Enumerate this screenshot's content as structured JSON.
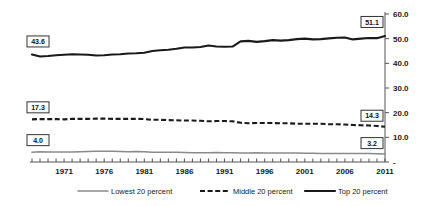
{
  "chart_data": {
    "type": "line",
    "title": "",
    "xlabel": "",
    "ylabel": "",
    "ylim": [
      0,
      60
    ],
    "xlim": [
      1967,
      2011
    ],
    "grid": false,
    "legend_position": "bottom",
    "y_ticks": [
      "-",
      "10.0",
      "20.0",
      "30.0",
      "40.0",
      "50.0",
      "60.0"
    ],
    "y_tick_values": [
      0,
      10,
      20,
      30,
      40,
      50,
      60
    ],
    "x_ticks": [
      "1971",
      "1976",
      "1981",
      "1986",
      "1991",
      "1996",
      "2001",
      "2006",
      "2011"
    ],
    "x_tick_values": [
      1971,
      1976,
      1981,
      1986,
      1991,
      1996,
      2001,
      2006,
      2011
    ],
    "x": [
      1967,
      1968,
      1969,
      1970,
      1971,
      1972,
      1973,
      1974,
      1975,
      1976,
      1977,
      1978,
      1979,
      1980,
      1981,
      1982,
      1983,
      1984,
      1985,
      1986,
      1987,
      1988,
      1989,
      1990,
      1991,
      1992,
      1993,
      1994,
      1995,
      1996,
      1997,
      1998,
      1999,
      2000,
      2001,
      2002,
      2003,
      2004,
      2005,
      2006,
      2007,
      2008,
      2009,
      2010,
      2011
    ],
    "series": [
      {
        "name": "Lowest 20 percent",
        "style": "solid-thin",
        "color": "#8a8a8a",
        "start_label": "4.0",
        "end_label": "3.2",
        "values": [
          4.0,
          4.2,
          4.1,
          4.1,
          4.1,
          4.1,
          4.2,
          4.3,
          4.4,
          4.4,
          4.4,
          4.3,
          4.2,
          4.3,
          4.2,
          4.0,
          4.0,
          4.0,
          4.0,
          3.9,
          3.8,
          3.8,
          3.8,
          3.9,
          3.8,
          3.8,
          3.6,
          3.6,
          3.7,
          3.6,
          3.6,
          3.6,
          3.6,
          3.6,
          3.5,
          3.5,
          3.4,
          3.4,
          3.4,
          3.4,
          3.4,
          3.4,
          3.4,
          3.3,
          3.2
        ]
      },
      {
        "name": "Middle 20 percent",
        "style": "dashed",
        "color": "#1a1a1a",
        "start_label": "17.3",
        "end_label": "14.3",
        "values": [
          17.3,
          17.4,
          17.4,
          17.4,
          17.3,
          17.5,
          17.5,
          17.5,
          17.6,
          17.6,
          17.5,
          17.5,
          17.5,
          17.5,
          17.4,
          17.1,
          17.1,
          17.0,
          16.9,
          16.8,
          16.8,
          16.7,
          16.5,
          16.6,
          16.6,
          16.5,
          15.9,
          15.7,
          15.8,
          15.8,
          15.8,
          15.7,
          15.7,
          15.5,
          15.5,
          15.5,
          15.5,
          15.3,
          15.3,
          15.2,
          15.0,
          14.9,
          14.8,
          14.6,
          14.3
        ]
      },
      {
        "name": "Top 20 percent",
        "style": "solid-thick",
        "color": "#1a1a1a",
        "start_label": "43.6",
        "end_label": "51.1",
        "values": [
          43.6,
          42.8,
          43.0,
          43.3,
          43.5,
          43.7,
          43.6,
          43.5,
          43.2,
          43.3,
          43.6,
          43.7,
          44.0,
          44.1,
          44.3,
          45.0,
          45.3,
          45.5,
          45.9,
          46.4,
          46.4,
          46.6,
          47.2,
          46.8,
          46.7,
          46.8,
          48.9,
          49.1,
          48.7,
          49.0,
          49.4,
          49.2,
          49.4,
          49.8,
          50.0,
          49.7,
          49.8,
          50.1,
          50.4,
          50.5,
          49.7,
          50.0,
          50.3,
          50.2,
          51.1
        ]
      }
    ]
  },
  "legend": {
    "items": [
      {
        "label": "Lowest 20 percent"
      },
      {
        "label": "Middle 20 percent"
      },
      {
        "label": "Top 20 percent"
      }
    ]
  }
}
